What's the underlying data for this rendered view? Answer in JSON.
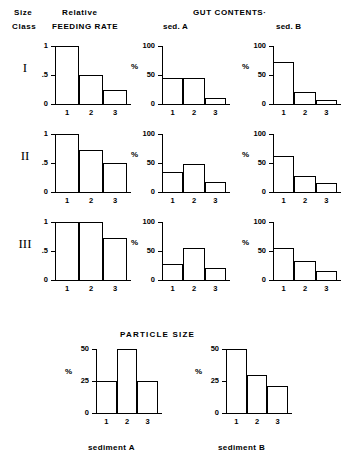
{
  "headings": {
    "size": "Size",
    "class": "Class",
    "relative": "Relative",
    "feeding_rate": "FEEDING RATE",
    "gut_contents": "GUT  CONTENTS·",
    "sed_a": "sed. A",
    "sed_b": "sed. B",
    "particle_size": "PARTICLE   SIZE",
    "sediment_a": "sediment A",
    "sediment_b": "sediment B"
  },
  "size_classes": [
    "I",
    "II",
    "III"
  ],
  "axis": {
    "feeding_ticks": [
      "1",
      ".5",
      "0"
    ],
    "gut_ticks": [
      "100",
      "50",
      "0"
    ],
    "particle_ticks": [
      "50",
      "25",
      "0"
    ],
    "categories": [
      "1",
      "2",
      "3"
    ],
    "percent_symbol": "%"
  },
  "chart_data": [
    {
      "type": "bar",
      "title": "Relative FEEDING RATE — Size Class I",
      "categories": [
        "1",
        "2",
        "3"
      ],
      "values": [
        1.0,
        0.5,
        0.25
      ],
      "xlabel": "",
      "ylabel": "",
      "ylim": [
        0,
        1
      ],
      "yticks": [
        0,
        0.5,
        1
      ],
      "ytick_labels": [
        "0",
        ".5",
        "1"
      ],
      "grid": false,
      "legend": "none"
    },
    {
      "type": "bar",
      "title": "GUT CONTENTS sed. A — Size Class I",
      "categories": [
        "1",
        "2",
        "3"
      ],
      "values": [
        45,
        45,
        10
      ],
      "xlabel": "",
      "ylabel": "%",
      "ylim": [
        0,
        100
      ],
      "yticks": [
        0,
        50,
        100
      ],
      "ytick_labels": [
        "0",
        "50",
        "100"
      ],
      "grid": false,
      "legend": "none"
    },
    {
      "type": "bar",
      "title": "GUT CONTENTS sed. B — Size Class I",
      "categories": [
        "1",
        "2",
        "3"
      ],
      "values": [
        72,
        20,
        7
      ],
      "xlabel": "",
      "ylabel": "%",
      "ylim": [
        0,
        100
      ],
      "yticks": [
        0,
        50,
        100
      ],
      "ytick_labels": [
        "0",
        "50",
        "100"
      ],
      "grid": false,
      "legend": "none"
    },
    {
      "type": "bar",
      "title": "Relative FEEDING RATE — Size Class II",
      "categories": [
        "1",
        "2",
        "3"
      ],
      "values": [
        1.0,
        0.72,
        0.5
      ],
      "xlabel": "",
      "ylabel": "",
      "ylim": [
        0,
        1
      ],
      "yticks": [
        0,
        0.5,
        1
      ],
      "ytick_labels": [
        "0",
        ".5",
        "1"
      ],
      "grid": false,
      "legend": "none"
    },
    {
      "type": "bar",
      "title": "GUT CONTENTS sed. A — Size Class II",
      "categories": [
        "1",
        "2",
        "3"
      ],
      "values": [
        35,
        48,
        18
      ],
      "xlabel": "",
      "ylabel": "%",
      "ylim": [
        0,
        100
      ],
      "yticks": [
        0,
        50,
        100
      ],
      "ytick_labels": [
        "0",
        "50",
        "100"
      ],
      "grid": false,
      "legend": "none"
    },
    {
      "type": "bar",
      "title": "GUT CONTENTS sed. B — Size Class II",
      "categories": [
        "1",
        "2",
        "3"
      ],
      "values": [
        62,
        27,
        15
      ],
      "xlabel": "",
      "ylabel": "%",
      "ylim": [
        0,
        100
      ],
      "yticks": [
        0,
        50,
        100
      ],
      "ytick_labels": [
        "0",
        "50",
        "100"
      ],
      "grid": false,
      "legend": "none"
    },
    {
      "type": "bar",
      "title": "Relative FEEDING RATE — Size Class III",
      "categories": [
        "1",
        "2",
        "3"
      ],
      "values": [
        1.0,
        1.0,
        0.72
      ],
      "xlabel": "",
      "ylabel": "",
      "ylim": [
        0,
        1
      ],
      "yticks": [
        0,
        0.5,
        1
      ],
      "ytick_labels": [
        "0",
        ".5",
        "1"
      ],
      "grid": false,
      "legend": "none"
    },
    {
      "type": "bar",
      "title": "GUT CONTENTS sed. A — Size Class III",
      "categories": [
        "1",
        "2",
        "3"
      ],
      "values": [
        28,
        55,
        20
      ],
      "xlabel": "",
      "ylabel": "%",
      "ylim": [
        0,
        100
      ],
      "yticks": [
        0,
        50,
        100
      ],
      "ytick_labels": [
        "0",
        "50",
        "100"
      ],
      "grid": false,
      "legend": "none"
    },
    {
      "type": "bar",
      "title": "GUT CONTENTS sed. B — Size Class III",
      "categories": [
        "1",
        "2",
        "3"
      ],
      "values": [
        55,
        32,
        15
      ],
      "xlabel": "",
      "ylabel": "%",
      "ylim": [
        0,
        100
      ],
      "yticks": [
        0,
        50,
        100
      ],
      "ytick_labels": [
        "0",
        "50",
        "100"
      ],
      "grid": false,
      "legend": "none"
    },
    {
      "type": "bar",
      "title": "PARTICLE SIZE — sediment A",
      "categories": [
        "1",
        "2",
        "3"
      ],
      "values": [
        25,
        50,
        25
      ],
      "xlabel": "sediment A",
      "ylabel": "%",
      "ylim": [
        0,
        50
      ],
      "yticks": [
        0,
        25,
        50
      ],
      "ytick_labels": [
        "0",
        "25",
        "50"
      ],
      "grid": false,
      "legend": "none"
    },
    {
      "type": "bar",
      "title": "PARTICLE SIZE — sediment B",
      "categories": [
        "1",
        "2",
        "3"
      ],
      "values": [
        50,
        30,
        21
      ],
      "xlabel": "sediment B",
      "ylabel": "%",
      "ylim": [
        0,
        50
      ],
      "yticks": [
        0,
        25,
        50
      ],
      "ytick_labels": [
        "0",
        "25",
        "50"
      ],
      "grid": false,
      "legend": "none"
    }
  ],
  "layout": {
    "charts": [
      {
        "x": 55,
        "y": 46,
        "w": 72,
        "h": 58,
        "kind": "feeding"
      },
      {
        "x": 162,
        "y": 46,
        "w": 64,
        "h": 58,
        "kind": "gut"
      },
      {
        "x": 273,
        "y": 46,
        "w": 64,
        "h": 58,
        "kind": "gut"
      },
      {
        "x": 55,
        "y": 134,
        "w": 72,
        "h": 58,
        "kind": "feeding"
      },
      {
        "x": 162,
        "y": 134,
        "w": 64,
        "h": 58,
        "kind": "gut"
      },
      {
        "x": 273,
        "y": 134,
        "w": 64,
        "h": 58,
        "kind": "gut"
      },
      {
        "x": 55,
        "y": 222,
        "w": 72,
        "h": 58,
        "kind": "feeding"
      },
      {
        "x": 162,
        "y": 222,
        "w": 64,
        "h": 58,
        "kind": "gut"
      },
      {
        "x": 273,
        "y": 222,
        "w": 64,
        "h": 58,
        "kind": "gut"
      },
      {
        "x": 96,
        "y": 349,
        "w": 62,
        "h": 64,
        "kind": "particle"
      },
      {
        "x": 226,
        "y": 349,
        "w": 62,
        "h": 64,
        "kind": "particle"
      }
    ]
  }
}
